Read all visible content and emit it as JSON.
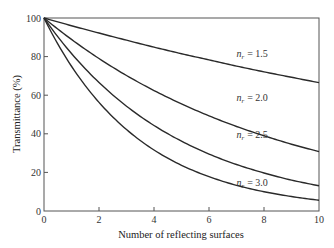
{
  "chart_data": {
    "type": "line",
    "title": "",
    "xlabel": "Number of reflecting surfaces",
    "ylabel": "Transmittance (%)",
    "xlim": [
      0,
      10
    ],
    "ylim": [
      0,
      100
    ],
    "x_ticks": [
      0,
      2,
      4,
      6,
      8,
      10
    ],
    "y_ticks": [
      0,
      20,
      40,
      60,
      80,
      100
    ],
    "grid": false,
    "legend_position": "inline labels on curves",
    "x": [
      0,
      1,
      2,
      3,
      4,
      5,
      6,
      7,
      8,
      9,
      10
    ],
    "series": [
      {
        "name": "n_r = 1.5",
        "label_sub": "r",
        "label_n": "n",
        "label_val": "= 1.5",
        "values": [
          100,
          96.0,
          92.2,
          88.5,
          84.9,
          81.5,
          78.3,
          75.1,
          72.1,
          69.3,
          66.5
        ]
      },
      {
        "name": "n_r = 2.0",
        "label_sub": "r",
        "label_n": "n",
        "label_val": "= 2.0",
        "values": [
          100,
          88.9,
          79.0,
          70.2,
          62.4,
          55.5,
          49.3,
          43.8,
          39.0,
          34.6,
          30.8
        ]
      },
      {
        "name": "n_r = 2.5",
        "label_sub": "r",
        "label_n": "n",
        "label_val": "= 2.5",
        "values": [
          100,
          81.6,
          66.6,
          54.3,
          44.3,
          36.2,
          29.5,
          24.1,
          19.7,
          16.0,
          13.1
        ]
      },
      {
        "name": "n_r = 3.0",
        "label_sub": "r",
        "label_n": "n",
        "label_val": "= 3.0",
        "values": [
          100,
          75.0,
          56.3,
          42.2,
          31.6,
          23.7,
          17.8,
          13.3,
          10.0,
          7.5,
          5.6
        ]
      }
    ],
    "label_positions": [
      {
        "x": 7.0,
        "y": 80
      },
      {
        "x": 7.0,
        "y": 57
      },
      {
        "x": 7.0,
        "y": 38
      },
      {
        "x": 7.0,
        "y": 13
      }
    ]
  }
}
